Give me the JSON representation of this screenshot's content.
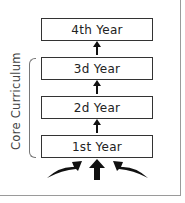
{
  "diagram": {
    "side_label": "Core Curriculum",
    "boxes": [
      {
        "label": "4th Year"
      },
      {
        "label": "3d Year"
      },
      {
        "label": "2d Year"
      },
      {
        "label": "1st Year"
      }
    ],
    "colors": {
      "box_border": "#333333",
      "arrow": "#111111",
      "frame": "#9a9a9a"
    }
  }
}
